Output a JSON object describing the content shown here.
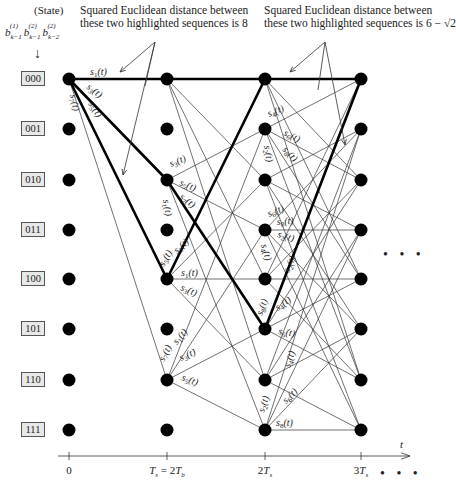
{
  "header": {
    "state_label": "(State)",
    "state_bits": [
      "b(1) k-1",
      "b(2) k-1",
      "b(2) k-2"
    ],
    "down_arrow": "↓"
  },
  "captions": {
    "left": [
      "Squared Euclidean distance between",
      "these two highlighted sequences is 8"
    ],
    "right": [
      "Squared Euclidean distance between",
      "these two highlighted sequences is 6 − √2"
    ]
  },
  "states": [
    "000",
    "001",
    "010",
    "011",
    "100",
    "101",
    "110",
    "111"
  ],
  "columns_x": [
    69,
    167,
    265,
    361
  ],
  "rows_y": [
    79,
    129,
    180,
    230,
    279,
    329,
    380,
    430
  ],
  "axis": {
    "y": 456,
    "x_start": 58,
    "x_end": 410,
    "ticks": [
      {
        "x": 69,
        "label": "0"
      },
      {
        "x": 167,
        "label": "Ts = 2Tb"
      },
      {
        "x": 265,
        "label": "2Ts"
      },
      {
        "x": 361,
        "label": "3Ts"
      }
    ],
    "variable": "t",
    "continuation": "• • •"
  },
  "side_continuation": "• • •",
  "highlighted_paths": [
    [
      [
        0,
        0
      ],
      [
        1,
        0
      ],
      [
        2,
        0
      ],
      [
        3,
        0
      ]
    ],
    [
      [
        0,
        0
      ],
      [
        1,
        4
      ],
      [
        2,
        0
      ]
    ],
    [
      [
        0,
        0
      ],
      [
        1,
        2
      ],
      [
        2,
        5
      ],
      [
        3,
        0
      ]
    ]
  ],
  "branch_labels": [
    {
      "text": "s1(t)",
      "x": 90,
      "y": 75,
      "rot": 0
    },
    {
      "text": "s3(t)",
      "x": 86,
      "y": 88,
      "rot": 38
    },
    {
      "text": "s5(t)",
      "x": 88,
      "y": 104,
      "rot": 56
    },
    {
      "text": "s7(t)",
      "x": 70,
      "y": 95,
      "rot": 78
    },
    {
      "text": "s3(t)",
      "x": 171,
      "y": 167,
      "rot": -22
    },
    {
      "text": "s5(t)",
      "x": 179,
      "y": 185,
      "rot": 22
    },
    {
      "text": "s7(t)",
      "x": 179,
      "y": 198,
      "rot": 38
    },
    {
      "text": "s1(t)",
      "x": 163,
      "y": 200,
      "rot": 80
    },
    {
      "text": "s5(t)",
      "x": 164,
      "y": 267,
      "rot": -60
    },
    {
      "text": "s3(t)",
      "x": 177,
      "y": 254,
      "rot": -42
    },
    {
      "text": "s1(t)",
      "x": 181,
      "y": 276,
      "rot": 0
    },
    {
      "text": "s3(t)",
      "x": 180,
      "y": 290,
      "rot": 22
    },
    {
      "text": "s7(t)",
      "x": 164,
      "y": 362,
      "rot": -62
    },
    {
      "text": "s1(t)",
      "x": 177,
      "y": 345,
      "rot": -50
    },
    {
      "text": "s3(t)",
      "x": 181,
      "y": 361,
      "rot": -24
    },
    {
      "text": "s5(t)",
      "x": 181,
      "y": 380,
      "rot": 20
    },
    {
      "text": "s4(t)",
      "x": 269,
      "y": 117,
      "rot": -22
    },
    {
      "text": "s6(t)",
      "x": 283,
      "y": 135,
      "rot": 26
    },
    {
      "text": "s8(t)",
      "x": 282,
      "y": 150,
      "rot": 46
    },
    {
      "text": "s2(t)",
      "x": 264,
      "y": 146,
      "rot": 80
    },
    {
      "text": "s6(t)",
      "x": 269,
      "y": 217,
      "rot": -22
    },
    {
      "text": "s8(t)",
      "x": 277,
      "y": 225,
      "rot": -4
    },
    {
      "text": "s2(t)",
      "x": 277,
      "y": 237,
      "rot": 16
    },
    {
      "text": "s4(t)",
      "x": 261,
      "y": 245,
      "rot": 74
    },
    {
      "text": "s2(t)",
      "x": 289,
      "y": 273,
      "rot": -66
    },
    {
      "text": "s8(t)",
      "x": 262,
      "y": 316,
      "rot": -70
    },
    {
      "text": "s4(t)",
      "x": 278,
      "y": 311,
      "rot": -36
    },
    {
      "text": "s6(t)",
      "x": 278,
      "y": 334,
      "rot": 10
    },
    {
      "text": "s4(t)",
      "x": 290,
      "y": 368,
      "rot": -72
    },
    {
      "text": "s6(t)",
      "x": 286,
      "y": 404,
      "rot": -44
    },
    {
      "text": "s2(t)",
      "x": 264,
      "y": 413,
      "rot": -72
    },
    {
      "text": "s8(t)",
      "x": 276,
      "y": 426,
      "rot": 0
    }
  ],
  "annotation_arrows": [
    {
      "from": [
        155,
        42
      ],
      "to": [
        120,
        72
      ]
    },
    {
      "from": [
        155,
        42
      ],
      "to": [
        145,
        86
      ],
      "noarrow": true
    },
    {
      "from": [
        155,
        42
      ],
      "to": [
        123,
        175
      ]
    },
    {
      "from": [
        325,
        42
      ],
      "to": [
        290,
        72
      ]
    },
    {
      "from": [
        325,
        42
      ],
      "to": [
        345,
        145
      ]
    },
    {
      "from": [
        325,
        42
      ],
      "to": [
        318,
        90
      ],
      "noarrow": true
    }
  ],
  "colors": {
    "node": "#000000",
    "edge": "#333333",
    "bold": "#000000",
    "box_fill": "#e8e8e8"
  }
}
